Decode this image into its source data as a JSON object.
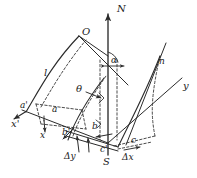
{
  "figure": {
    "type": "geometric-diagram",
    "title": "",
    "background_color": "#ffffff",
    "stroke_color": "#2b2b2b",
    "width": 197,
    "height": 178
  },
  "axes": {
    "vertical_north": {
      "label": "N",
      "position": "top",
      "arrow": "up"
    },
    "vertical_south": {
      "label": "S",
      "position": "bottom"
    },
    "y_axis": {
      "label": "y",
      "position": "right"
    },
    "x_axis": {
      "label": "x",
      "position": "bottom-left",
      "arrow": "down"
    },
    "x_prime_axis": {
      "label": "x'",
      "position": "left",
      "arrow": "down-left"
    }
  },
  "points": {
    "origin_top": "O",
    "node_right": "n",
    "corner_a": "a",
    "corner_a_prime": "a'",
    "corner_b": "b",
    "corner_b_prime": "b'",
    "corner_c": "c",
    "corner_c_prime": "c'"
  },
  "angles": {
    "alpha": "α",
    "theta": "θ"
  },
  "increments": {
    "delta_x": "Δx",
    "delta_y": "Δy"
  },
  "arc": {
    "length_label": "l"
  }
}
